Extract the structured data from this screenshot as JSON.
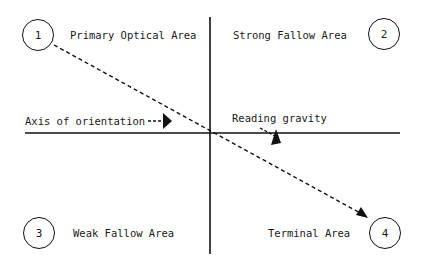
{
  "diagram": {
    "quadrants": [
      {
        "number": "1",
        "label": "Primary Optical Area"
      },
      {
        "number": "2",
        "label": "Strong Fallow Area"
      },
      {
        "number": "3",
        "label": "Weak Fallow Area"
      },
      {
        "number": "4",
        "label": "Terminal Area"
      }
    ],
    "annotations": {
      "axis": "Axis of orientation",
      "gravity": "Reading gravity"
    },
    "colors": {
      "stroke": "#111111",
      "text": "#1a1a1a",
      "background": "#ffffff"
    }
  }
}
